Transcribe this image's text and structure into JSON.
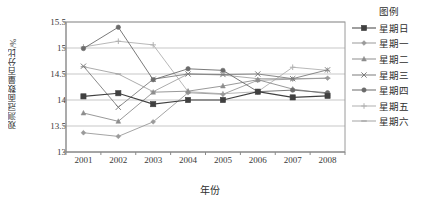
{
  "chart_data": {
    "type": "line",
    "title": "",
    "xlabel": "年份",
    "ylabel": "观测冠面数量百分比/%",
    "legend_title": "图例",
    "legend_position": "right",
    "grid": true,
    "categories": [
      "2001",
      "2002",
      "2003",
      "2004",
      "2005",
      "2006",
      "2007",
      "2008"
    ],
    "x": [
      2001,
      2002,
      2003,
      2004,
      2005,
      2006,
      2007,
      2008
    ],
    "ylim": [
      13,
      15.5
    ],
    "yticks": [
      "13",
      "13.5",
      "14",
      "14.5",
      "15",
      "15.5"
    ],
    "ytick_values": [
      13,
      13.5,
      14,
      14.5,
      15,
      15.5
    ],
    "series": [
      {
        "name": "星期日",
        "color": "#404040",
        "marker": "square",
        "values": [
          14.07,
          14.13,
          13.92,
          14.0,
          14.0,
          14.16,
          14.05,
          14.08
        ]
      },
      {
        "name": "星期一",
        "color": "#9a9a9a",
        "marker": "diamond",
        "values": [
          13.37,
          13.3,
          13.58,
          14.14,
          14.11,
          14.38,
          14.4,
          14.42
        ]
      },
      {
        "name": "星期二",
        "color": "#8d8d8d",
        "marker": "triangle",
        "values": [
          13.75,
          13.59,
          14.15,
          14.17,
          14.27,
          14.39,
          14.21,
          14.12
        ]
      },
      {
        "name": "星期三",
        "color": "#7d7d7d",
        "marker": "cross",
        "values": [
          14.65,
          13.86,
          14.4,
          14.5,
          14.49,
          14.5,
          14.41,
          14.58
        ]
      },
      {
        "name": "星期四",
        "color": "#6b6b6b",
        "marker": "circle",
        "values": [
          14.99,
          15.4,
          14.39,
          14.6,
          14.57,
          14.16,
          14.19,
          14.14
        ]
      },
      {
        "name": "星期五",
        "color": "#b0b0b0",
        "marker": "plus",
        "values": [
          15.02,
          15.13,
          15.06,
          14.16,
          14.12,
          14.16,
          14.63,
          14.57
        ]
      },
      {
        "name": "星期六",
        "color": "#a3a3a3",
        "marker": "dash",
        "values": [
          14.64,
          14.5,
          14.16,
          14.5,
          14.48,
          14.41,
          14.41,
          14.42
        ]
      }
    ]
  },
  "legend": {
    "title": "图例",
    "items": [
      {
        "label": "星期日"
      },
      {
        "label": "星期一"
      },
      {
        "label": "星期二"
      },
      {
        "label": "星期三"
      },
      {
        "label": "星期四"
      },
      {
        "label": "星期五"
      },
      {
        "label": "星期六"
      }
    ]
  }
}
